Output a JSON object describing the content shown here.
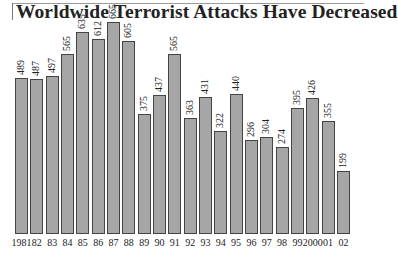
{
  "title": "Worldwide Terrorist Attacks Have Decreased",
  "chart_data": {
    "type": "bar",
    "title": "Worldwide Terrorist Attacks Have Decreased",
    "xlabel": "",
    "ylabel": "",
    "categories": [
      "1981",
      "82",
      "83",
      "84",
      "85",
      "86",
      "87",
      "88",
      "89",
      "90",
      "91",
      "92",
      "93",
      "94",
      "95",
      "96",
      "97",
      "98",
      "99",
      "2000",
      "01",
      "02"
    ],
    "values": [
      489,
      487,
      497,
      565,
      635,
      612,
      665,
      605,
      375,
      437,
      565,
      363,
      431,
      322,
      440,
      296,
      304,
      274,
      395,
      426,
      355,
      199
    ],
    "ylim": [
      0,
      700
    ],
    "grid": false,
    "legend": null,
    "bar_color": "#a6a6a6",
    "bar_edge_color": "#444444"
  }
}
